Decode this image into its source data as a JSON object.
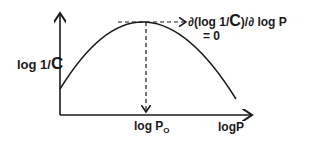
{
  "diagram": {
    "y_axis_label_prefix": "log 1/",
    "y_axis_label_var": "C",
    "x_axis_label": "logP",
    "optimum_label_prefix": "log P",
    "optimum_label_subscript": "O",
    "derivative_label_prefix": "∂(log 1/",
    "derivative_label_var": "C",
    "derivative_label_suffix": ")/∂ log P",
    "derivative_equals": "= 0",
    "curve": "parabola",
    "stroke_color": "#1a1a1a"
  }
}
